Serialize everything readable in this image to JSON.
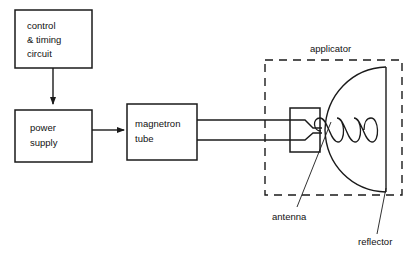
{
  "diagram": {
    "background_color": "#ffffff",
    "line_color": "#1a1a1a",
    "blocks": [
      {
        "id": "control-timing-circuit",
        "lines": [
          "control",
          "& timing",
          "circuit"
        ],
        "x": 15,
        "y": 10,
        "w": 77,
        "h": 58
      },
      {
        "id": "power-supply",
        "lines": [
          "power",
          "supply"
        ],
        "x": 15,
        "y": 110,
        "w": 77,
        "h": 52
      },
      {
        "id": "magnetron-tube",
        "lines": [
          "magnetron",
          "tube"
        ],
        "x": 127,
        "y": 104,
        "w": 70,
        "h": 56
      }
    ],
    "callouts": [
      {
        "id": "applicator",
        "label": "applicator",
        "x": 310,
        "y": 50
      },
      {
        "id": "antenna",
        "label": "antenna",
        "x": 272,
        "y": 220
      },
      {
        "id": "reflector",
        "label": "reflector",
        "x": 358,
        "y": 245
      }
    ],
    "applicator_boundary": {
      "x": 265,
      "y": 60,
      "w": 137,
      "h": 135,
      "style": "dashed"
    },
    "components": {
      "waveguide": {
        "top_y": 120,
        "bottom_y": 140,
        "from_x": 197,
        "to_x": 290
      },
      "transition": {
        "x": 290,
        "y": 108,
        "w": 30,
        "h": 44
      },
      "antenna_coil": {
        "turns": 5,
        "start_x": 320,
        "end_x": 372,
        "center_y": 130
      },
      "reflector_dish": {
        "apex_x": 325,
        "edge_x": 386,
        "top_y": 67,
        "bottom_y": 192
      }
    },
    "connectors": [
      {
        "id": "control-to-power",
        "type": "arrow",
        "direction": "down"
      },
      {
        "id": "power-to-magnetron",
        "type": "arrow",
        "direction": "right"
      }
    ]
  }
}
